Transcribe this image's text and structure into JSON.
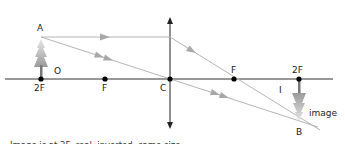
{
  "diagram": {
    "labels": {
      "object_top": "A",
      "object": "O",
      "image_tip": "B",
      "image": "I",
      "image_text": "image",
      "left_2f": "2F",
      "left_f": "F",
      "center": "C",
      "right_f": "F",
      "right_2f": "2F"
    },
    "caption": "Image is at 2F, real, inverted, same size",
    "colors": {
      "axis": "#333333",
      "ray": "#b0b0b0",
      "arrowhead": "#a8a8a8",
      "lens": "#222222",
      "point": "#000000",
      "tree": "#a0a0a0"
    }
  }
}
